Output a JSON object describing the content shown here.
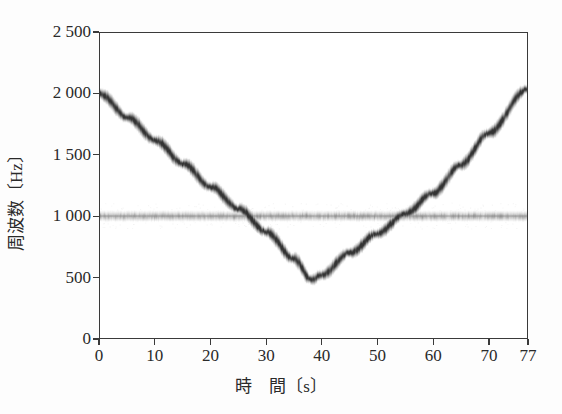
{
  "chart_data": {
    "type": "heatmap",
    "title": "",
    "subtitle": "",
    "xlabel": "時　間〔s〕",
    "ylabel": "周波数〔Hz〕",
    "xlim": [
      0,
      77
    ],
    "ylim": [
      0,
      2500
    ],
    "grid": false,
    "legend": "none",
    "xticks": [
      0,
      10,
      20,
      30,
      40,
      50,
      60,
      70,
      77
    ],
    "xtick_labels": [
      "0",
      "10",
      "20",
      "30",
      "40",
      "50",
      "60",
      "70",
      "77"
    ],
    "yticks": [
      0,
      500,
      1000,
      1500,
      2000,
      2500
    ],
    "ytick_labels": [
      "0",
      "500",
      "1 000",
      "1 500",
      "2 000",
      "2 500"
    ],
    "series": [
      {
        "name": "chirp-trace",
        "kind": "v-shaped-sweep",
        "x": [
          0,
          5,
          10,
          15,
          20,
          25,
          30,
          35,
          38,
          40,
          45,
          50,
          55,
          60,
          65,
          70,
          77
        ],
        "values": [
          2000,
          1810,
          1620,
          1430,
          1240,
          1060,
          870,
          650,
          480,
          520,
          700,
          860,
          1020,
          1190,
          1420,
          1680,
          2040
        ],
        "intensity": "dark-gray",
        "color": "#585858"
      },
      {
        "name": "constant-tone-band",
        "kind": "horizontal-band",
        "frequency": 1000,
        "band_halfwidth": 60,
        "x_range": [
          0,
          77
        ],
        "intensity": "light-gray-striated",
        "color": "#9a9a9a"
      }
    ]
  },
  "axes": {
    "y_title": "周波数〔Hz〕",
    "x_title": "時　間〔s〕",
    "y_labels": [
      "2 500",
      "2 000",
      "1 500",
      "1 000",
      "500",
      "0"
    ],
    "y_values": [
      2500,
      2000,
      1500,
      1000,
      500,
      0
    ],
    "x_labels": [
      "0",
      "10",
      "20",
      "30",
      "40",
      "50",
      "60",
      "70",
      "77"
    ],
    "x_values": [
      0,
      10,
      20,
      30,
      40,
      50,
      60,
      70,
      77
    ]
  },
  "colors": {
    "background": "#fdfdfd",
    "plot_background": "#ffffff",
    "axis": "#3a3a3a",
    "text": "#2a2a2a",
    "trace": "#585858",
    "band": "#9a9a9a"
  }
}
